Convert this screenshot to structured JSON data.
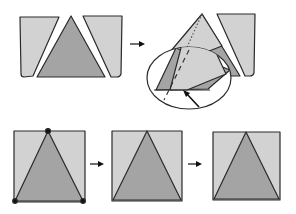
{
  "diagram": {
    "type": "folding-instructions",
    "colors": {
      "light_panel": "#d2d2d2",
      "dark_triangle": "#a4a4a4",
      "outline": "#2a2a2a",
      "background": "#ffffff"
    },
    "top_row": {
      "step1": "three separate pieces: two side panels and a center triangle",
      "arrow": "right-arrow",
      "step2": "side panel folded over triangle with magnified detail circle and pointer arrow"
    },
    "bottom_row": {
      "steps": [
        {
          "description": "square with triangle, corner dots marked"
        },
        {
          "description": "square with triangle, edges joined"
        },
        {
          "description": "finished square with triangle"
        }
      ],
      "arrows": [
        "right-arrow",
        "right-arrow"
      ]
    }
  }
}
